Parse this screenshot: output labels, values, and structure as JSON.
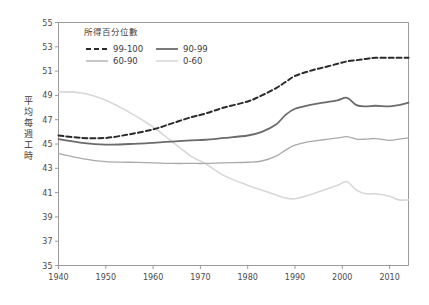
{
  "chart_data": {
    "type": "line",
    "title": "",
    "subtitle": "",
    "xlabel": "",
    "ylabel": "平均每週工時",
    "xlim": [
      1940,
      2014
    ],
    "ylim": [
      35,
      55
    ],
    "xticks": [
      1940,
      1950,
      1960,
      1970,
      1980,
      1990,
      2000,
      2010
    ],
    "yticks": [
      35,
      37,
      39,
      41,
      43,
      45,
      47,
      49,
      51,
      53,
      55
    ],
    "grid": false,
    "legend": {
      "title": "所得百分位數",
      "position": "upper-left-inside",
      "entries": [
        {
          "name": "99-100",
          "color": "#2b2b2b",
          "style": "dashed",
          "width": 2.0
        },
        {
          "name": "90-99",
          "color": "#6b6b6b",
          "style": "solid",
          "width": 1.8
        },
        {
          "name": "60-90",
          "color": "#aaaaaa",
          "style": "solid",
          "width": 1.3
        },
        {
          "name": "0-60",
          "color": "#d8d8d8",
          "style": "solid",
          "width": 1.6
        }
      ]
    },
    "x": [
      1940,
      1945,
      1950,
      1955,
      1960,
      1964,
      1968,
      1971,
      1975,
      1980,
      1983,
      1986,
      1988,
      1990,
      1993,
      1996,
      1999,
      2001,
      2003,
      2005,
      2007,
      2010,
      2012,
      2014
    ],
    "series": [
      {
        "name": "99-100",
        "color": "#2b2b2b",
        "style": "dashed",
        "values": [
          45.7,
          45.5,
          45.5,
          45.8,
          46.2,
          46.7,
          47.2,
          47.5,
          48.0,
          48.5,
          49.0,
          49.6,
          50.1,
          50.6,
          51.0,
          51.3,
          51.6,
          51.8,
          51.9,
          52.0,
          52.1,
          52.1,
          52.1,
          52.1
        ]
      },
      {
        "name": "90-99",
        "color": "#6b6b6b",
        "style": "solid",
        "values": [
          45.4,
          45.1,
          44.95,
          45.0,
          45.1,
          45.2,
          45.3,
          45.35,
          45.5,
          45.7,
          46.0,
          46.6,
          47.4,
          47.9,
          48.2,
          48.4,
          48.6,
          48.8,
          48.2,
          48.1,
          48.15,
          48.1,
          48.2,
          48.4
        ]
      },
      {
        "name": "60-90",
        "color": "#aaaaaa",
        "style": "solid",
        "values": [
          44.2,
          43.8,
          43.55,
          43.5,
          43.45,
          43.4,
          43.4,
          43.4,
          43.45,
          43.5,
          43.6,
          44.0,
          44.5,
          44.9,
          45.2,
          45.35,
          45.5,
          45.6,
          45.4,
          45.4,
          45.45,
          45.3,
          45.4,
          45.5
        ]
      },
      {
        "name": "0-60",
        "color": "#d8d8d8",
        "style": "solid",
        "values": [
          49.3,
          49.2,
          48.6,
          47.6,
          46.4,
          45.2,
          44.0,
          43.4,
          42.4,
          41.6,
          41.2,
          40.8,
          40.55,
          40.5,
          40.8,
          41.2,
          41.6,
          41.9,
          41.2,
          40.9,
          40.9,
          40.7,
          40.4,
          40.4
        ]
      }
    ]
  },
  "ylabel_chars": [
    "平",
    "均",
    "每",
    "週",
    "工",
    "時"
  ]
}
